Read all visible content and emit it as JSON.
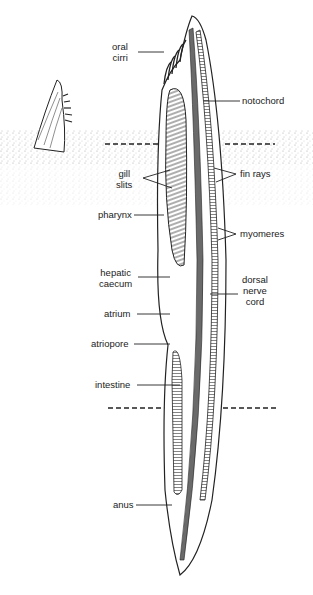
{
  "labels": {
    "oral_cirri": "oral\ncirri",
    "notochord": "notochord",
    "gill_slits": "gill\nslits",
    "fin_rays": "fin rays",
    "pharynx": "pharynx",
    "myomeres": "myomeres",
    "hepatic_caecum": "hepatic\ncaecum",
    "dorsal_nerve_cord": "dorsal\nnerve\ncord",
    "atrium": "atrium",
    "atriopore": "atriopore",
    "intestine": "intestine",
    "anus": "anus"
  },
  "colors": {
    "ink": "#222222",
    "sand": "#9a9a9a",
    "background": "#ffffff"
  }
}
